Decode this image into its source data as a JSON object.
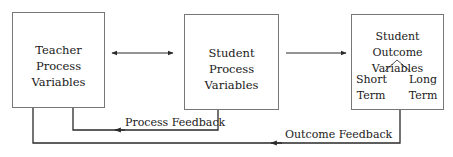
{
  "diagram": {
    "nodes": {
      "teacher_process": {
        "line1": "Teacher Process",
        "line2": "Variables"
      },
      "student_process": {
        "line1": "Student Process",
        "line2": "Variables"
      },
      "student_outcome": {
        "line1": "Student Outcome",
        "line2": "Variables",
        "branches": {
          "short": {
            "line1": "Short",
            "line2": "Term"
          },
          "long": {
            "line1": "Long",
            "line2": "Term"
          }
        }
      }
    },
    "edges": {
      "teacher_student_process": {
        "type": "bidirectional"
      },
      "student_process_outcome": {
        "type": "directed"
      },
      "process_feedback": {
        "label": "Process Feedback"
      },
      "outcome_feedback": {
        "label": "Outcome Feedback"
      }
    },
    "colors": {
      "line": "#2a2a2a",
      "box_border": "#777777",
      "text": "#1a1a1a"
    }
  }
}
